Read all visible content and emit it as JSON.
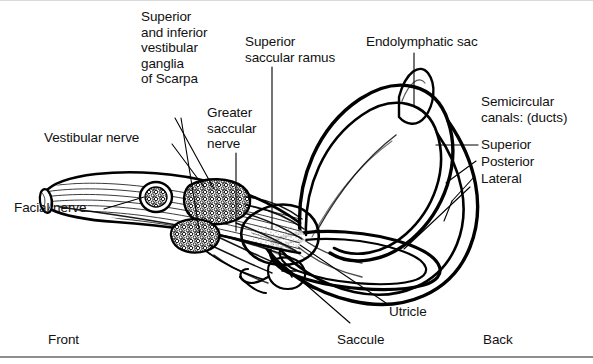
{
  "figure": {
    "orientation": {
      "front": "Front",
      "back": "Back"
    },
    "labels": {
      "superior_inferior_ganglia": "Superior\nand inferior\nvestibular\nganglia\nof Scarpa",
      "superior_saccular_ramus": "Superior\nsaccular ramus",
      "endolymphatic_sac": "Endolymphatic sac",
      "semicircular_canals": "Semicircular\ncanals: (ducts)",
      "canal_superior": "Superior",
      "canal_posterior": "Posterior",
      "canal_lateral": "Lateral",
      "greater_saccular_nerve": "Greater\nsaccular\nnerve",
      "vestibular_nerve": "Vestibular nerve",
      "facial_nerve": "Facial nerve",
      "utricle": "Utricle",
      "saccule": "Saccule"
    },
    "colors": {
      "ink": "#000000",
      "paper": "#ffffff",
      "rule": "#8e8e8e"
    }
  }
}
